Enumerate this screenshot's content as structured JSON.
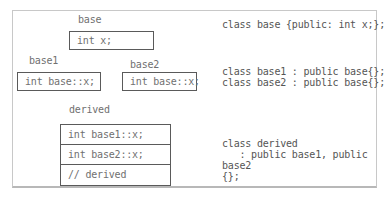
{
  "diagram": {
    "base": {
      "title": "base",
      "member": "int x;"
    },
    "base1": {
      "title": "base1",
      "member": "int base::x;"
    },
    "base2": {
      "title": "base2",
      "member": "int base::x;"
    },
    "derived": {
      "title": "derived",
      "rows": [
        "int base1::x;",
        "int base2::x;",
        "// derived"
      ]
    }
  },
  "code": {
    "base_decl": "class base {public: int x;};",
    "base1_decl": "class base1 : public base{};",
    "base2_decl": "class base2 : public base{};",
    "derived_decl": [
      "class derived",
      "   : public base1, public",
      "base2",
      "{};"
    ]
  }
}
